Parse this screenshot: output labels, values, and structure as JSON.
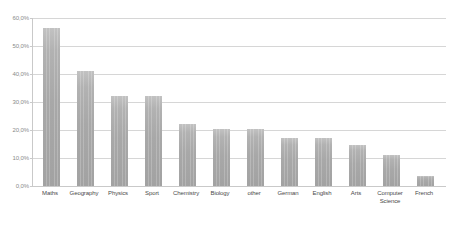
{
  "chart_data": {
    "type": "bar",
    "title": "",
    "subtitle": "",
    "xlabel": "",
    "ylabel": "",
    "categories": [
      "Maths",
      "Geography",
      "Physics",
      "Sport",
      "Chemistry",
      "Biology",
      "other",
      "German",
      "English",
      "Arts",
      "Computer Science",
      "French"
    ],
    "values": [
      56.5,
      41.0,
      32.0,
      32.0,
      22.0,
      20.3,
      20.5,
      17.3,
      17.3,
      14.5,
      11.0,
      3.5
    ],
    "value_labels": [
      "56,5%",
      "41,0%",
      "32,0%",
      "32,0%",
      "22,0%",
      "20,3%",
      "20,5%",
      "17,3%",
      "17,3%",
      "14,5%",
      "11,0%",
      "3,5%"
    ],
    "ylim": [
      0,
      60
    ],
    "ytick_values": [
      0,
      10,
      20,
      30,
      40,
      50,
      60
    ],
    "ytick_labels": [
      "0,0%",
      "10,0%",
      "20,0%",
      "30,0%",
      "40,0%",
      "50,0%",
      "60,0%"
    ],
    "grid": true,
    "legend": false,
    "legend_position": "none",
    "series": [
      {
        "name": "",
        "values": [
          56.5,
          41.0,
          32.0,
          32.0,
          22.0,
          20.3,
          20.5,
          17.3,
          17.3,
          14.5,
          11.0,
          3.5
        ]
      }
    ],
    "colors": {
      "bar_top": "#c2c2c2",
      "bar_bottom": "#a2a2a2",
      "gridline": "#d6d6d6",
      "axis": "#c9c9c9",
      "ylabel_text": "#8a8a8a",
      "xlabel_text": "#4a4a4a",
      "background": "#ffffff"
    }
  }
}
